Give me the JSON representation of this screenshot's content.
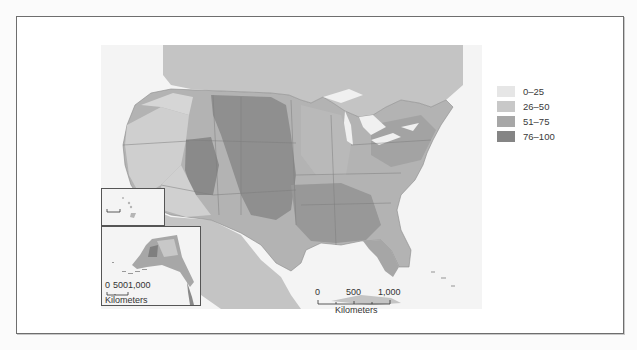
{
  "figure": {
    "type": "choropleth map",
    "region": "United States (counties)"
  },
  "legend": {
    "items": [
      {
        "label": "0–25",
        "color": "#e6e6e6"
      },
      {
        "label": "26–50",
        "color": "#c8c8c8"
      },
      {
        "label": "51–75",
        "color": "#a7a7a7"
      },
      {
        "label": "76–100",
        "color": "#858585"
      }
    ]
  },
  "main_scale_bar": {
    "ticks": [
      "0",
      "500",
      "1,000"
    ],
    "unit": "Kilometers"
  },
  "alaska_scale_bar": {
    "ticks": [
      "0",
      "500",
      "1,000"
    ],
    "unit": "Kilometers"
  },
  "colors": {
    "ocean": "#f4f4f4",
    "neighbor_land": "#c4c4c4",
    "lakes": "#f0f0f0",
    "border": "#6e6e6e"
  }
}
